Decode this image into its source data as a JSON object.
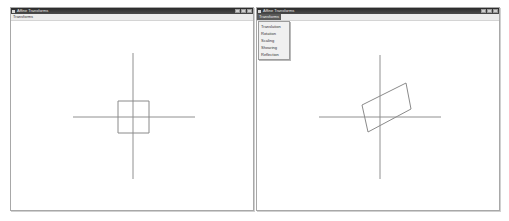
{
  "windows": [
    {
      "title": "Affine Transforms",
      "menu": [
        "Transforms"
      ],
      "controls": [
        "minimize",
        "maximize",
        "close"
      ],
      "axes": {
        "h": {
          "x1": 62,
          "x2": 184,
          "y": 96
        },
        "v": {
          "x": 122,
          "y1": 32,
          "y2": 158
        }
      },
      "shape": {
        "type": "square",
        "points": "107,80 138,80 138,112 107,112"
      }
    },
    {
      "title": "Affine Transforms",
      "menu": [
        "Transforms"
      ],
      "controls": [
        "minimize",
        "maximize",
        "close"
      ],
      "dropdown_open": true,
      "dropdown_items": [
        "Translation",
        "Rotation",
        "Scaling",
        "Shearing",
        "Reflection"
      ],
      "axes": {
        "h": {
          "x1": 62,
          "x2": 184,
          "y": 96
        },
        "v": {
          "x": 123,
          "y1": 34,
          "y2": 158
        }
      },
      "shape": {
        "type": "transformed-quad",
        "points": "105,84 149,62 154,88 111,111"
      }
    }
  ],
  "colors": {
    "line": "#909090",
    "shape": "#8a8a8a",
    "titlebar": "#333333"
  }
}
